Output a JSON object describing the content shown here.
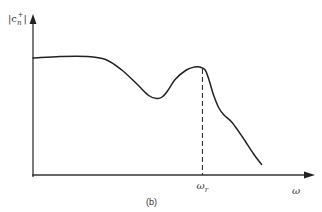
{
  "chart_data": {
    "type": "line",
    "title": "",
    "caption": "(b)",
    "xlabel": "ω",
    "ylabel": "|c_n^+|",
    "ylabel_parts": {
      "base": "|c",
      "sub": "n",
      "sup": "+",
      "end": "|"
    },
    "x_tick_labels": [
      {
        "x": 0.63,
        "label": "ω_r",
        "base": "ω",
        "sub": "r"
      }
    ],
    "xlim": [
      0,
      1
    ],
    "ylim": [
      0,
      1
    ],
    "grid": false,
    "annotations": [
      {
        "type": "dashed-vertical-line",
        "x": 0.63,
        "label": "ω_r"
      }
    ],
    "series": [
      {
        "name": "|c_n^+| spectrum",
        "x": [
          0.0,
          0.1,
          0.2,
          0.27,
          0.33,
          0.39,
          0.43,
          0.46,
          0.48,
          0.5,
          0.53,
          0.57,
          0.6,
          0.62,
          0.64,
          0.655,
          0.67,
          0.69,
          0.71,
          0.74,
          0.78,
          0.82,
          0.85
        ],
        "values": [
          0.78,
          0.79,
          0.79,
          0.77,
          0.7,
          0.6,
          0.53,
          0.51,
          0.52,
          0.56,
          0.64,
          0.7,
          0.72,
          0.72,
          0.7,
          0.63,
          0.54,
          0.45,
          0.4,
          0.35,
          0.25,
          0.14,
          0.07
        ]
      }
    ]
  }
}
